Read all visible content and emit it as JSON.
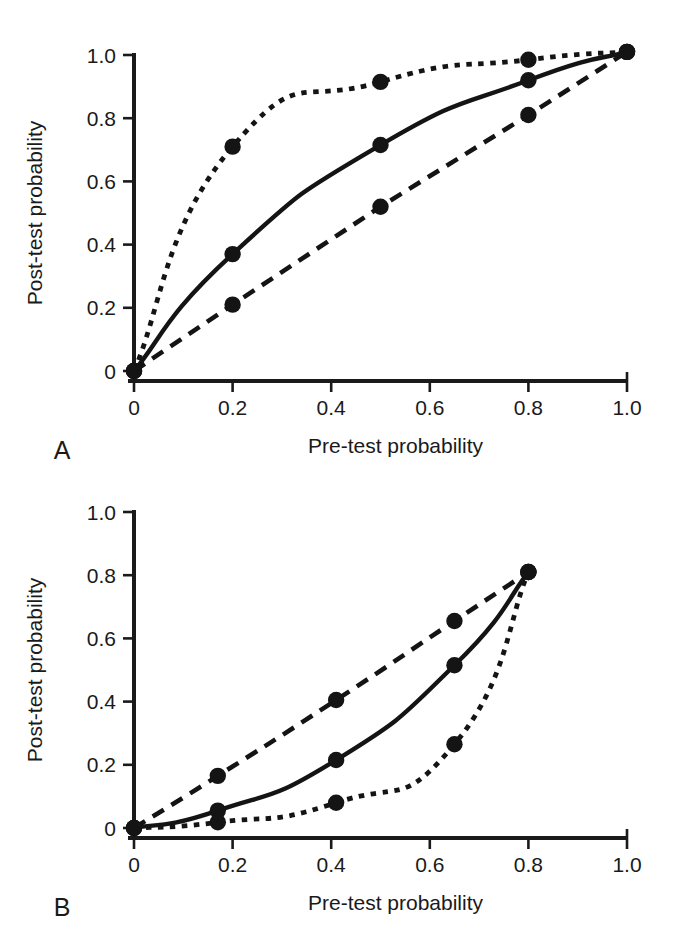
{
  "figure": {
    "background": "#ffffff",
    "ink_color": "#141414",
    "panels": [
      {
        "letter": "A",
        "id": "panel-a"
      },
      {
        "letter": "B",
        "id": "panel-b"
      }
    ]
  },
  "chart_data": [
    {
      "panel": "A",
      "type": "line",
      "title": "",
      "xlabel": "Pre-test probability",
      "ylabel": "Post-test probability",
      "xlim": [
        0,
        1.0
      ],
      "ylim": [
        0,
        1.0
      ],
      "xticks": [
        0,
        0.2,
        0.4,
        0.6,
        0.8,
        1.0
      ],
      "xticklabels": [
        "0",
        "0.2",
        "0.4",
        "0.6",
        "0.8",
        "1.0"
      ],
      "yticks": [
        0,
        0.2,
        0.4,
        0.6,
        0.8,
        1.0
      ],
      "yticklabels": [
        "0",
        "0.2",
        "0.4",
        "0.6",
        "0.8",
        "1.0"
      ],
      "grid": false,
      "legend": "none",
      "markers": "filled-circle",
      "series": [
        {
          "name": "upper-curve",
          "linestyle": "dotted",
          "x": [
            0.0,
            0.2,
            0.5,
            0.8,
            1.0
          ],
          "y": [
            0.0,
            0.71,
            0.915,
            0.985,
            1.01
          ]
        },
        {
          "name": "middle-curve",
          "linestyle": "solid",
          "x": [
            0.0,
            0.2,
            0.5,
            0.8,
            1.0
          ],
          "y": [
            0.0,
            0.37,
            0.715,
            0.92,
            1.01
          ]
        },
        {
          "name": "lower-curve",
          "linestyle": "dashed",
          "x": [
            0.0,
            0.2,
            0.5,
            0.8,
            1.0
          ],
          "y": [
            0.0,
            0.21,
            0.52,
            0.81,
            1.01
          ]
        }
      ]
    },
    {
      "panel": "B",
      "type": "line",
      "title": "",
      "xlabel": "Pre-test probability",
      "ylabel": "Post-test probability",
      "xlim": [
        0,
        1.0
      ],
      "ylim": [
        0,
        1.0
      ],
      "xticks": [
        0,
        0.2,
        0.4,
        0.6,
        0.8,
        1.0
      ],
      "xticklabels": [
        "0",
        "0.2",
        "0.4",
        "0.6",
        "0.8",
        "1.0"
      ],
      "yticks": [
        0,
        0.2,
        0.4,
        0.6,
        0.8,
        1.0
      ],
      "yticklabels": [
        "0",
        "0.2",
        "0.4",
        "0.6",
        "0.8",
        "1.0"
      ],
      "grid": false,
      "legend": "none",
      "markers": "filled-circle",
      "series": [
        {
          "name": "upper-curve",
          "linestyle": "dashed",
          "x": [
            0.0,
            0.17,
            0.41,
            0.65,
            0.8
          ],
          "y": [
            0.0,
            0.165,
            0.405,
            0.655,
            0.81
          ]
        },
        {
          "name": "middle-curve",
          "linestyle": "solid",
          "x": [
            0.0,
            0.17,
            0.41,
            0.65,
            0.8
          ],
          "y": [
            0.0,
            0.055,
            0.215,
            0.515,
            0.81
          ]
        },
        {
          "name": "lower-curve",
          "linestyle": "dotted",
          "x": [
            0.0,
            0.17,
            0.41,
            0.65,
            0.8
          ],
          "y": [
            0.0,
            0.018,
            0.08,
            0.265,
            0.81
          ]
        }
      ]
    }
  ]
}
